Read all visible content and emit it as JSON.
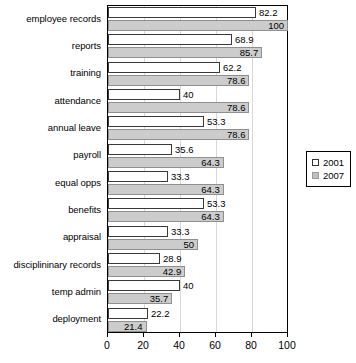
{
  "chart_data": {
    "type": "bar",
    "orientation": "horizontal",
    "title": "",
    "xlabel": "",
    "ylabel": "",
    "xlim": [
      0,
      100
    ],
    "xticks": [
      0,
      20,
      40,
      60,
      80,
      100
    ],
    "grid": true,
    "legend_position": "right",
    "categories": [
      "employee records",
      "reports",
      "training",
      "attendance",
      "annual leave",
      "payroll",
      "equal opps",
      "benefits",
      "appraisal",
      "disciplininary records",
      "temp admin",
      "deployment"
    ],
    "series": [
      {
        "name": "2001",
        "color": "#ffffff",
        "values": [
          82.2,
          68.9,
          62.2,
          40,
          53.3,
          35.6,
          33.3,
          53.3,
          33.3,
          28.9,
          40,
          22.2
        ],
        "labels": [
          "82.2",
          "68.9",
          "62.2",
          "40",
          "53.3",
          "35.6",
          "33.3",
          "53.3",
          "33.3",
          "28.9",
          "40",
          "22.2"
        ]
      },
      {
        "name": "2007",
        "color": "#cccccc",
        "values": [
          100,
          85.7,
          78.6,
          78.6,
          78.6,
          64.3,
          64.3,
          64.3,
          50,
          42.9,
          35.7,
          21.4
        ],
        "labels": [
          "100",
          "85.7",
          "78.6",
          "78.6",
          "78.6",
          "64.3",
          "64.3",
          "64.3",
          "50",
          "42.9",
          "35.7",
          "21.4"
        ]
      }
    ]
  },
  "legend": {
    "items": [
      {
        "label": "2001",
        "swatch": "open-square-swatch"
      },
      {
        "label": "2007",
        "swatch": "gray-square-swatch"
      }
    ]
  }
}
